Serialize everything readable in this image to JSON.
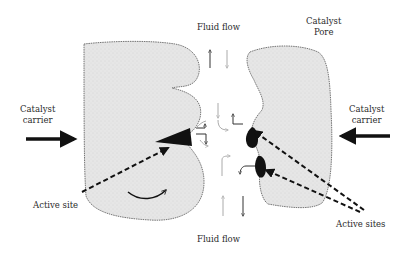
{
  "diagram": {
    "labels": {
      "fluid_flow_top": "Fluid flow",
      "fluid_flow_bottom": "Fluid flow",
      "catalyst_pore_line1": "Catalyst",
      "catalyst_pore_line2": "Pore",
      "left_carrier_line1": "Catalyst",
      "left_carrier_line2": "carrier",
      "right_carrier_line1": "Catalyst",
      "right_carrier_line2": "carrier",
      "active_site": "Active site",
      "active_sites": "Active sites"
    },
    "colors": {
      "blob_fill": "#e4e4e4",
      "blob_stroke": "#555555",
      "active_site": "#111111",
      "arrow": "#111111",
      "flow_dark": "#333333",
      "flow_light": "#b0b0b0"
    }
  }
}
